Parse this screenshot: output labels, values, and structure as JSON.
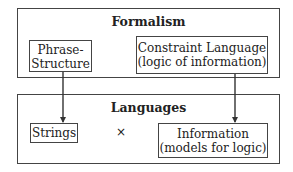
{
  "formalism": {
    "title": "Formalism",
    "left_box": {
      "line1": "Phrase-",
      "line2": "Structure"
    },
    "right_box": {
      "line1": "Constraint Language",
      "line2": "(logic of information)"
    }
  },
  "languages": {
    "title": "Languages",
    "left_box": {
      "line1": "Strings"
    },
    "operator": "×",
    "right_box": {
      "line1": "Information",
      "line2": "(models for logic)"
    }
  },
  "edges": [
    {
      "from": "Phrase-Structure",
      "to": "Strings"
    },
    {
      "from": "Constraint Language (logic of information)",
      "to": "Information (models for logic)"
    }
  ]
}
